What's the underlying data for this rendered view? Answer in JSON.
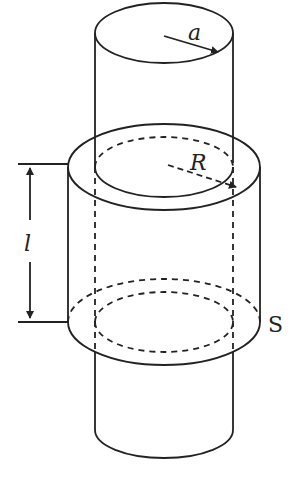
{
  "figure": {
    "labels": {
      "inner_radius": "a",
      "outer_radius": "R",
      "length": "l",
      "surface": "S"
    },
    "colors": {
      "stroke": "#222222",
      "background": "#ffffff"
    }
  }
}
